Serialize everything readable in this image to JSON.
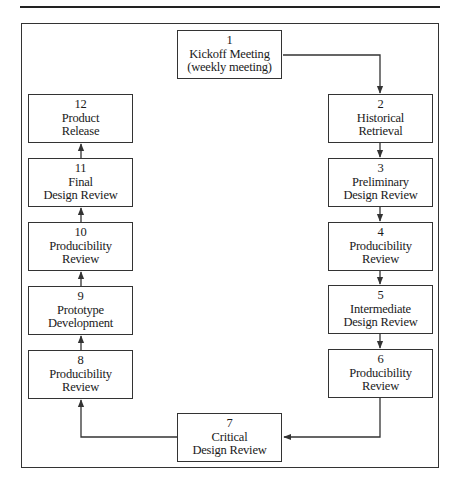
{
  "diagram": {
    "type": "process-flow-cycle",
    "steps": [
      {
        "number": "1",
        "lines": [
          "Kickoff Meeting",
          "(weekly meeting)"
        ]
      },
      {
        "number": "2",
        "lines": [
          "Historical",
          "Retrieval"
        ]
      },
      {
        "number": "3",
        "lines": [
          "Preliminary",
          "Design Review"
        ]
      },
      {
        "number": "4",
        "lines": [
          "Producibility",
          "Review"
        ]
      },
      {
        "number": "5",
        "lines": [
          "Intermediate",
          "Design Review"
        ]
      },
      {
        "number": "6",
        "lines": [
          "Producibility",
          "Review"
        ]
      },
      {
        "number": "7",
        "lines": [
          "Critical",
          "Design Review"
        ]
      },
      {
        "number": "8",
        "lines": [
          "Producibility",
          "Review"
        ]
      },
      {
        "number": "9",
        "lines": [
          "Prototype",
          "Development"
        ]
      },
      {
        "number": "10",
        "lines": [
          "Producibility",
          "Review"
        ]
      },
      {
        "number": "11",
        "lines": [
          "Final",
          "Design Review"
        ]
      },
      {
        "number": "12",
        "lines": [
          "Product",
          "Release"
        ]
      }
    ],
    "flow": [
      "1→2",
      "2→3",
      "3→4",
      "4→5",
      "5→6",
      "6→7",
      "7→8",
      "8→9",
      "9→10",
      "10→11",
      "11→12"
    ],
    "colors": {
      "line": "#333333",
      "text": "#1a1a1a",
      "background": "#ffffff"
    }
  }
}
